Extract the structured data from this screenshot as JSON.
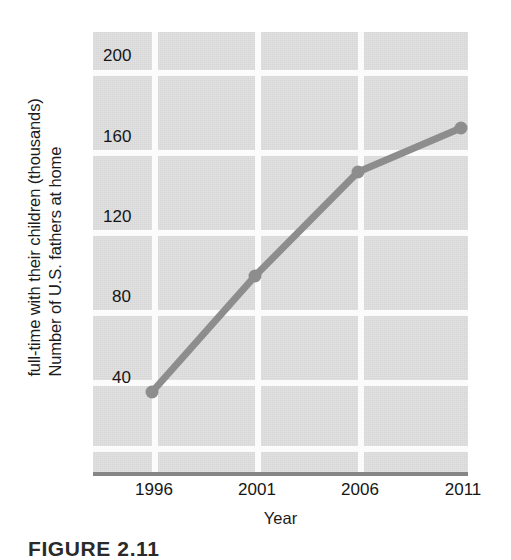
{
  "chart_data": {
    "type": "line",
    "title": "",
    "xlabel": "Year",
    "ylabel": "Number of U.S. fathers at home full-time with their children (thousands)",
    "ylabel_line1": "Number of U.S. fathers at home",
    "ylabel_line2": "full-time with their children (thousands)",
    "x": [
      1996,
      2001,
      2006,
      2011
    ],
    "categories": [
      "1996",
      "2001",
      "2006",
      "2011"
    ],
    "values": [
      40,
      98,
      150,
      172
    ],
    "series": [
      {
        "name": "U.S. stay-at-home fathers",
        "values": [
          40,
          98,
          150,
          172
        ]
      }
    ],
    "xtick_labels": [
      "1996",
      "2001",
      "2006",
      "2011"
    ],
    "ytick_labels": [
      "200",
      "160",
      "120",
      "80",
      "40"
    ],
    "ytick_values": [
      200,
      160,
      120,
      80,
      40
    ],
    "ylim": [
      0,
      220
    ],
    "xlim": [
      1994,
      2011
    ],
    "grid": true,
    "legend": "none",
    "marker": "circle",
    "line_color": "#8d8d8d",
    "marker_color": "#8d8d8d",
    "plot_background": "#d7d7d7",
    "gridline_color": "#fbfbfb",
    "axis_color": "#868686",
    "text_color": "#161616"
  },
  "caption": {
    "text": "FIGURE 2.11"
  }
}
